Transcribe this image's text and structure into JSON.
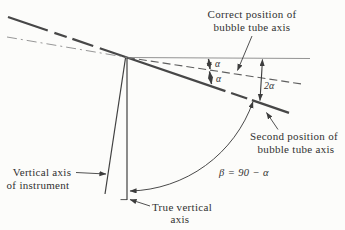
{
  "diagram": {
    "correct_position": {
      "line1": "Correct position of",
      "line2": "bubble tube axis"
    },
    "second_position": {
      "line1": "Second position of",
      "line2": "bubble tube axis"
    },
    "instrument_axis": {
      "line1": "Vertical axis",
      "line2": "of instrument"
    },
    "true_vertical": {
      "line1": "True vertical",
      "line2": "axis"
    },
    "angles": {
      "alpha_above": "α",
      "alpha_below": "α",
      "two_alpha": "2α",
      "beta_equation": "β = 90 − α"
    },
    "colors": {
      "ink": "#474747",
      "light_ink": "#8a8a8a",
      "text": "#313131",
      "paper": "#fcfcfa"
    }
  }
}
